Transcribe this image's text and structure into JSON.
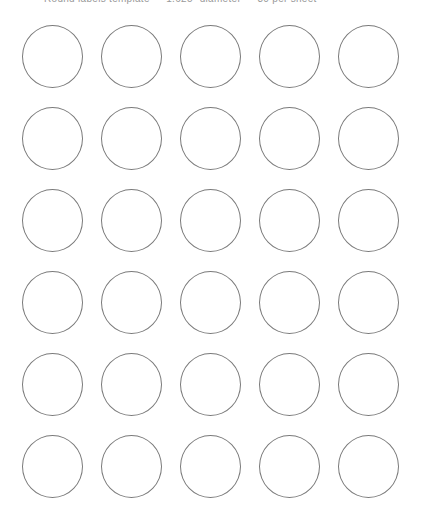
{
  "header": {
    "text": "Round labels template — 1.625\" diameter — 30 per sheet"
  },
  "sheet": {
    "columns": 5,
    "rows": 6,
    "circle_diameter_px": 61,
    "stroke_color": "#7a7a7a",
    "background_color": "#ffffff",
    "column_centers_px": [
      52,
      131,
      210,
      289,
      368
    ],
    "row_centers_px": [
      57,
      139,
      221,
      303,
      385,
      467
    ]
  }
}
